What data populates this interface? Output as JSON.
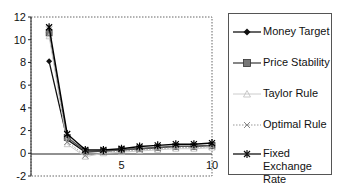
{
  "chart_data": {
    "type": "line",
    "title": "",
    "xlabel": "",
    "ylabel": "",
    "xlim": [
      0,
      10
    ],
    "ylim": [
      -2,
      12
    ],
    "x_ticks": [
      "5",
      "10"
    ],
    "y_ticks": [
      "-2",
      "0",
      "2",
      "4",
      "6",
      "8",
      "10",
      "12"
    ],
    "x": [
      1,
      2,
      3,
      4,
      5,
      6,
      7,
      8,
      9,
      10
    ],
    "series": [
      {
        "name": "Money Target",
        "marker": "diamond",
        "style": "solid-dark",
        "values": [
          8.1,
          1.2,
          0.1,
          0.2,
          0.3,
          0.4,
          0.5,
          0.6,
          0.6,
          0.7
        ]
      },
      {
        "name": "Price Stability",
        "marker": "square",
        "style": "solid-gray",
        "values": [
          10.6,
          1.4,
          0.2,
          0.2,
          0.3,
          0.4,
          0.5,
          0.6,
          0.6,
          0.7
        ]
      },
      {
        "name": "Taylor Rule",
        "marker": "triangle",
        "style": "light",
        "values": [
          10.3,
          0.8,
          -0.3,
          0.0,
          0.1,
          0.2,
          0.3,
          0.4,
          0.4,
          0.5
        ]
      },
      {
        "name": "Optimal Rule",
        "marker": "x",
        "style": "dotted",
        "values": [
          10.9,
          1.0,
          -0.2,
          0.1,
          0.2,
          0.3,
          0.4,
          0.5,
          0.5,
          0.6
        ]
      },
      {
        "name": "Fixed Exchange Rate",
        "marker": "star",
        "style": "solid-black",
        "values": [
          11.1,
          1.7,
          0.3,
          0.3,
          0.4,
          0.6,
          0.7,
          0.8,
          0.8,
          0.9
        ]
      }
    ],
    "grid": false,
    "legend_position": "right"
  },
  "legend": {
    "items": [
      {
        "label": "Money Target"
      },
      {
        "label": "Price Stability"
      },
      {
        "label": "Taylor Rule"
      },
      {
        "label": "Optimal Rule"
      },
      {
        "label": "Fixed Exchange Rate"
      }
    ]
  }
}
